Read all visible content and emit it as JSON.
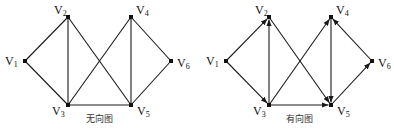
{
  "graphs": [
    {
      "id": "undirected",
      "caption": "无向图",
      "directed": false,
      "nodes": [
        {
          "id": "V1",
          "name": "V",
          "sub": "1",
          "x": 25,
          "y": 61
        },
        {
          "id": "V2",
          "name": "V",
          "sub": "2",
          "x": 68,
          "y": 17
        },
        {
          "id": "V3",
          "name": "V",
          "sub": "3",
          "x": 68,
          "y": 105
        },
        {
          "id": "V4",
          "name": "V",
          "sub": "4",
          "x": 131,
          "y": 17
        },
        {
          "id": "V5",
          "name": "V",
          "sub": "5",
          "x": 131,
          "y": 105
        },
        {
          "id": "V6",
          "name": "V",
          "sub": "6",
          "x": 171,
          "y": 61
        }
      ],
      "edges": [
        [
          "V1",
          "V2"
        ],
        [
          "V1",
          "V3"
        ],
        [
          "V2",
          "V3"
        ],
        [
          "V2",
          "V5"
        ],
        [
          "V3",
          "V4"
        ],
        [
          "V3",
          "V5"
        ],
        [
          "V4",
          "V5"
        ],
        [
          "V4",
          "V6"
        ],
        [
          "V5",
          "V6"
        ]
      ]
    },
    {
      "id": "directed",
      "caption": "有向图",
      "directed": true,
      "nodes": [
        {
          "id": "V1",
          "name": "V",
          "sub": "1",
          "x": 26,
          "y": 61
        },
        {
          "id": "V2",
          "name": "V",
          "sub": "2",
          "x": 69,
          "y": 17
        },
        {
          "id": "V3",
          "name": "V",
          "sub": "3",
          "x": 69,
          "y": 105
        },
        {
          "id": "V4",
          "name": "V",
          "sub": "4",
          "x": 131,
          "y": 17
        },
        {
          "id": "V5",
          "name": "V",
          "sub": "5",
          "x": 131,
          "y": 105
        },
        {
          "id": "V6",
          "name": "V",
          "sub": "6",
          "x": 172,
          "y": 61
        }
      ],
      "edges": [
        [
          "V1",
          "V2"
        ],
        [
          "V1",
          "V3"
        ],
        [
          "V3",
          "V2"
        ],
        [
          "V2",
          "V5"
        ],
        [
          "V3",
          "V4"
        ],
        [
          "V3",
          "V5"
        ],
        [
          "V4",
          "V5"
        ],
        [
          "V6",
          "V4"
        ],
        [
          "V5",
          "V6"
        ]
      ]
    }
  ],
  "colors": {
    "line": "#1a1a1a",
    "node": "#111111",
    "background": "#ffffff"
  }
}
